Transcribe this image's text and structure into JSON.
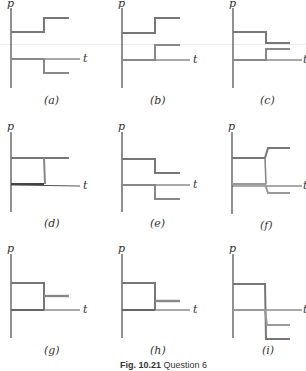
{
  "figure": {
    "caption_label": "Fig. 10.21",
    "caption_text": "Question 6",
    "axis_labels": {
      "y": "p",
      "x": "t"
    },
    "colors": {
      "axis": "#444444",
      "upper_path": "#777777",
      "lower_path": "#999999"
    }
  },
  "panels": [
    {
      "id": "a",
      "label": "(a)",
      "description": "upper level steps up; lower level steps down below axis"
    },
    {
      "id": "b",
      "label": "(b)",
      "description": "upper level steps up; lower level steps up"
    },
    {
      "id": "c",
      "label": "(c)",
      "description": "upper level steps down; lower level steps up"
    },
    {
      "id": "d",
      "label": "(d)",
      "description": "upper level constant; lower level constant; vertical connector"
    },
    {
      "id": "e",
      "label": "(e)",
      "description": "upper level steps down; lower level steps down below axis"
    },
    {
      "id": "f",
      "label": "(f)",
      "description": "upper level steps up; lower level steps down below axis, with slanted transition"
    },
    {
      "id": "g",
      "label": "(g)",
      "description": "upper level drops to intermediate level; lower level ends at step"
    },
    {
      "id": "h",
      "label": "(h)",
      "description": "upper level drops to intermediate level; lower level ends at step"
    },
    {
      "id": "i",
      "label": "(i)",
      "description": "both levels drop below axis after step"
    }
  ]
}
